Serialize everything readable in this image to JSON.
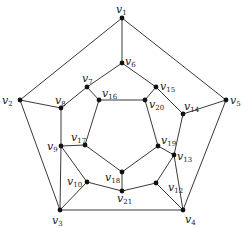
{
  "diagram": {
    "type": "graph",
    "vertex_prefix": "v",
    "vertices": [
      {
        "id": "1",
        "x": 122,
        "y": 18,
        "lx": 116,
        "ly": 13
      },
      {
        "id": "2",
        "x": 20,
        "y": 100,
        "lx": 2,
        "ly": 104
      },
      {
        "id": "3",
        "x": 60,
        "y": 210,
        "lx": 52,
        "ly": 224
      },
      {
        "id": "4",
        "x": 183,
        "y": 210,
        "lx": 185,
        "ly": 223
      },
      {
        "id": "5",
        "x": 226,
        "y": 100,
        "lx": 230,
        "ly": 104
      },
      {
        "id": "6",
        "x": 122,
        "y": 63,
        "lx": 125,
        "ly": 65
      },
      {
        "id": "7",
        "x": 87,
        "y": 87,
        "lx": 82,
        "ly": 82
      },
      {
        "id": "8",
        "x": 61,
        "y": 108,
        "lx": 55,
        "ly": 104
      },
      {
        "id": "9",
        "x": 61,
        "y": 146,
        "lx": 47,
        "ly": 150
      },
      {
        "id": "10",
        "x": 87,
        "y": 182,
        "lx": 67,
        "ly": 185
      },
      {
        "id": "12",
        "x": 156,
        "y": 183,
        "lx": 168,
        "ly": 191
      },
      {
        "id": "13",
        "x": 174,
        "y": 155,
        "lx": 177,
        "ly": 160
      },
      {
        "id": "14",
        "x": 183,
        "y": 114,
        "lx": 184,
        "ly": 110
      },
      {
        "id": "15",
        "x": 156,
        "y": 87,
        "lx": 160,
        "ly": 90
      },
      {
        "id": "16",
        "x": 99,
        "y": 100,
        "lx": 102,
        "ly": 97
      },
      {
        "id": "17",
        "x": 85,
        "y": 145,
        "lx": 71,
        "ly": 141
      },
      {
        "id": "18",
        "x": 122,
        "y": 172,
        "lx": 105,
        "ly": 181
      },
      {
        "id": "19",
        "x": 158,
        "y": 146,
        "lx": 161,
        "ly": 144
      },
      {
        "id": "20",
        "x": 145,
        "y": 100,
        "lx": 149,
        "ly": 108
      },
      {
        "id": "21",
        "x": 122,
        "y": 191,
        "lx": 117,
        "ly": 202
      }
    ],
    "edges": [
      [
        "1",
        "2"
      ],
      [
        "2",
        "3"
      ],
      [
        "3",
        "4"
      ],
      [
        "4",
        "5"
      ],
      [
        "5",
        "1"
      ],
      [
        "1",
        "6"
      ],
      [
        "6",
        "7"
      ],
      [
        "6",
        "15"
      ],
      [
        "2",
        "8"
      ],
      [
        "8",
        "7"
      ],
      [
        "8",
        "9"
      ],
      [
        "3",
        "9"
      ],
      [
        "3",
        "10"
      ],
      [
        "9",
        "10"
      ],
      [
        "4",
        "12"
      ],
      [
        "12",
        "13"
      ],
      [
        "4",
        "13"
      ],
      [
        "5",
        "14"
      ],
      [
        "14",
        "15"
      ],
      [
        "14",
        "13"
      ],
      [
        "7",
        "16"
      ],
      [
        "15",
        "20"
      ],
      [
        "16",
        "20"
      ],
      [
        "16",
        "17"
      ],
      [
        "9",
        "17"
      ],
      [
        "17",
        "18"
      ],
      [
        "20",
        "19"
      ],
      [
        "19",
        "18"
      ],
      [
        "19",
        "13"
      ],
      [
        "18",
        "21"
      ],
      [
        "10",
        "21"
      ],
      [
        "21",
        "12"
      ]
    ]
  }
}
